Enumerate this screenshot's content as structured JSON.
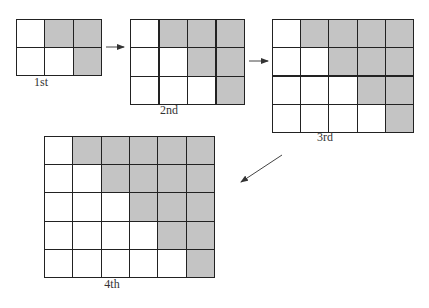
{
  "figures": [
    {
      "label": "1st",
      "rows": 2,
      "cols": 3,
      "x": 16,
      "y": 19,
      "w": 86,
      "h": 57,
      "label_x": 29,
      "label_y": 85
    },
    {
      "label": "2nd",
      "rows": 3,
      "cols": 4,
      "x": 130,
      "y": 19,
      "w": 115,
      "h": 86,
      "label_x": 157,
      "label_y": 113
    },
    {
      "label": "3rd",
      "rows": 4,
      "cols": 5,
      "x": 272,
      "y": 19,
      "w": 142,
      "h": 114,
      "label_x": 313,
      "label_y": 140
    },
    {
      "label": "4th",
      "rows": 5,
      "cols": 6,
      "x": 44,
      "y": 136,
      "w": 171,
      "h": 142,
      "label_x": 100,
      "label_y": 287
    }
  ],
  "shading_rule": "cell shaded when col > row (0-indexed)",
  "colors": {
    "shaded": "#c4c4c4",
    "line": "#222222",
    "background": "#ffffff"
  },
  "arrows": [
    {
      "from": "1st",
      "to": "2nd",
      "x1": 106,
      "y1": 47,
      "x2": 124,
      "y2": 47
    },
    {
      "from": "2nd",
      "to": "3rd",
      "x1": 249,
      "y1": 61,
      "x2": 268,
      "y2": 61
    },
    {
      "from": "3rd",
      "to": "4th",
      "x1": 282,
      "y1": 155,
      "x2": 241,
      "y2": 182
    }
  ]
}
